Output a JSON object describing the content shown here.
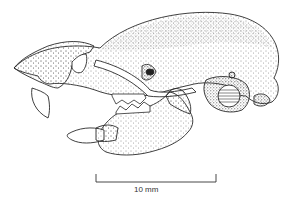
{
  "figure": {
    "style": "stippled pen-and-ink",
    "ink_color": "#2a2a2a",
    "background": "#ffffff"
  },
  "scale_bar": {
    "label": "10 mm",
    "x_start": 96,
    "x_end": 216,
    "y": 182
  }
}
